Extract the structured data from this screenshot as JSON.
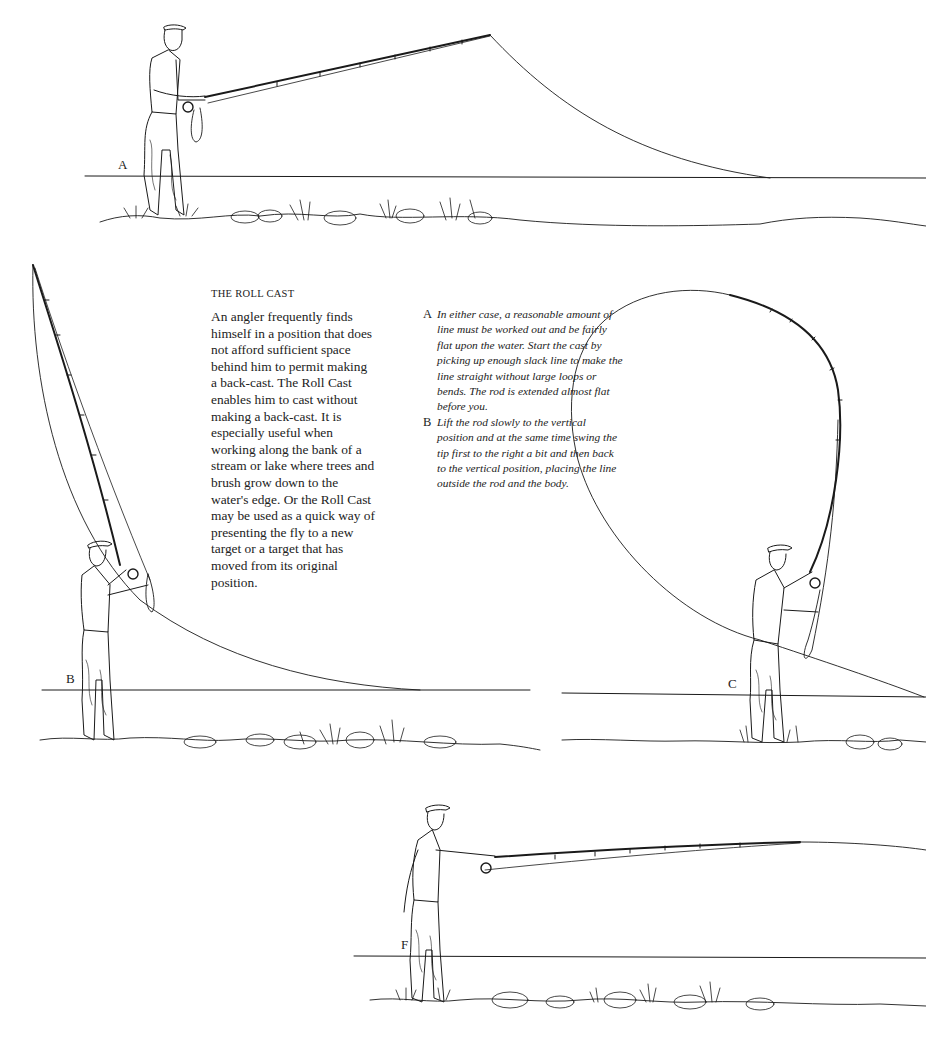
{
  "page": {
    "heading": "THE ROLL CAST",
    "body": "An angler frequently finds himself in a position that does not afford sufficient space behind him to permit making a back-cast. The Roll Cast enables him to cast without making a back-cast. It is especially useful when working along the bank of a stream or lake where trees and brush grow down to the water's edge. Or the Roll Cast may be used as a quick way of presenting the fly to a new target or a target that has moved from its original position.",
    "steps": [
      {
        "letter": "A",
        "text": "In either case, a reasonable amount of line must be worked out and be fairly flat upon the water. Start the cast by picking up enough slack line to make the line straight without large loops or bends. The rod is extended almost flat before you."
      },
      {
        "letter": "B",
        "text": "Lift the rod slowly to the vertical position and at the same time swing the tip first to the right a bit and then back to the vertical position, placing the line outside the rod and the body."
      }
    ]
  },
  "figures": [
    {
      "id": "A",
      "label": "A",
      "description": "Angler with rod extended almost flat, line lying on water"
    },
    {
      "id": "B",
      "label": "B",
      "description": "Angler lifting rod to vertical, line curving behind"
    },
    {
      "id": "C",
      "label": "C",
      "description": "Rod bent forward with large line loop rolling out"
    },
    {
      "id": "F",
      "label": "F",
      "description": "Angler with rod extended forward at finish of cast"
    }
  ],
  "colors": {
    "ink": "#1a1a1a",
    "paper": "#ffffff"
  }
}
